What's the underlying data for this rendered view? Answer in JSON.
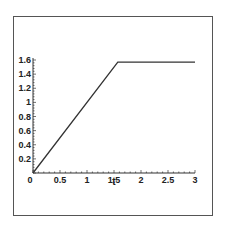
{
  "chart_data": {
    "type": "line",
    "title": "",
    "xlabel": "t",
    "ylabel": "",
    "xlim": [
      0,
      3
    ],
    "ylim": [
      0,
      1.6
    ],
    "grid": false,
    "legend": null,
    "x_ticks": [
      "0",
      "0.5",
      "1",
      "1.5",
      "2",
      "2.5",
      "3"
    ],
    "y_ticks": [
      "0.2",
      "0.4",
      "0.6",
      "0.8",
      "1",
      "1.2",
      "1.4",
      "1.6"
    ],
    "series": [
      {
        "name": "curve",
        "color": "#333333",
        "x": [
          0,
          1.5708,
          3
        ],
        "y": [
          0,
          1.5708,
          1.5708
        ]
      }
    ]
  },
  "colors": {
    "line": "#333333",
    "axis": "#333333",
    "frame": "#555555",
    "background": "#ffffff"
  }
}
